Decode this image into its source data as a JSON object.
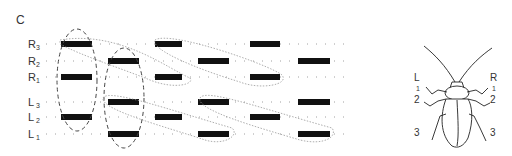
{
  "panel_label": "C",
  "rows": [
    {
      "letter": "R",
      "num": "3",
      "y": 44,
      "bars": [
        [
          61,
          92
        ],
        [
          155,
          182
        ],
        [
          250,
          280
        ]
      ]
    },
    {
      "letter": "R",
      "num": "2",
      "y": 61,
      "bars": [
        [
          108,
          139
        ],
        [
          198,
          229
        ],
        [
          298,
          330
        ]
      ]
    },
    {
      "letter": "R",
      "num": "1",
      "y": 77,
      "bars": [
        [
          61,
          92
        ],
        [
          155,
          182
        ],
        [
          250,
          280
        ]
      ]
    },
    {
      "letter": "L",
      "num": "3",
      "y": 102,
      "bars": [
        [
          108,
          139
        ],
        [
          198,
          229
        ],
        [
          298,
          330
        ]
      ]
    },
    {
      "letter": "L",
      "num": "2",
      "y": 117,
      "bars": [
        [
          61,
          92
        ],
        [
          155,
          182
        ],
        [
          250,
          280
        ]
      ]
    },
    {
      "letter": "L",
      "num": "1",
      "y": 134,
      "bars": [
        [
          108,
          139
        ],
        [
          198,
          229
        ],
        [
          298,
          330
        ]
      ]
    }
  ],
  "insect": {
    "name": "cockroach",
    "left_side": {
      "letter": "L",
      "legs": [
        "1",
        "2",
        "3"
      ]
    },
    "right_side": {
      "letter": "R",
      "legs": [
        "1",
        "2",
        "3"
      ]
    }
  },
  "colors": {
    "bar": "#111111",
    "dashed": "#444444",
    "dotted": "#888888",
    "ink": "#333333"
  }
}
